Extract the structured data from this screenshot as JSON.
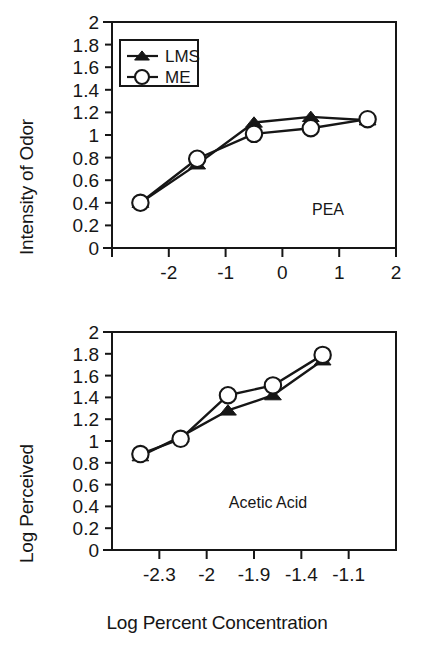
{
  "figure": {
    "background": "#ffffff",
    "ink": "#161616",
    "xaxis_title": "Log Percent Concentration"
  },
  "legend": {
    "entries": [
      {
        "label": "LMS",
        "marker": "filled-triangle"
      },
      {
        "label": "ME",
        "marker": "open-circle"
      }
    ]
  },
  "panels": {
    "top": {
      "ylabel": "Intensity of Odor",
      "annotation": "PEA"
    },
    "bottom": {
      "ylabel": "Log Perceived",
      "annotation": "Acetic Acid"
    }
  },
  "chart_data": [
    {
      "type": "line",
      "title": "PEA",
      "xlabel": "",
      "ylabel": "Intensity of Odor",
      "xlim": [
        -3,
        2
      ],
      "ylim": [
        0,
        2
      ],
      "xticks": [
        -3,
        -2,
        -1,
        0,
        1,
        2
      ],
      "xticklabels": [
        "",
        "-2",
        "-1",
        "0",
        "1",
        "2"
      ],
      "yticks": [
        0,
        0.2,
        0.4,
        0.6,
        0.8,
        1,
        1.2,
        1.4,
        1.6,
        1.8,
        2
      ],
      "yticklabels": [
        "0",
        "0.2",
        "0.4",
        "0.6",
        "0.8",
        "1",
        "1.2",
        "1.4",
        "1.6",
        "1.8",
        "2"
      ],
      "grid": false,
      "legend_position": "upper-left",
      "x": [
        -2.5,
        -1.5,
        -0.5,
        0.5,
        1.5
      ],
      "series": [
        {
          "name": "LMS",
          "marker": "filled-triangle",
          "values": [
            0.4,
            0.74,
            1.11,
            1.16,
            1.13
          ]
        },
        {
          "name": "ME",
          "marker": "open-circle",
          "values": [
            0.4,
            0.79,
            1.01,
            1.06,
            1.14
          ]
        }
      ]
    },
    {
      "type": "line",
      "title": "Acetic Acid",
      "xlabel": "Log Percent Concentration",
      "ylabel": "Log Perceived",
      "ylim": [
        0,
        2
      ],
      "xticklabels": [
        "-2.3",
        "-2",
        "-1.9",
        "-1.4",
        "-1.1"
      ],
      "xtick_positions": [
        1,
        2,
        3,
        4,
        5
      ],
      "yticks": [
        0,
        0.2,
        0.4,
        0.6,
        0.8,
        1,
        1.2,
        1.4,
        1.6,
        1.8,
        2
      ],
      "yticklabels": [
        "0",
        "0.2",
        "0.4",
        "0.6",
        "0.8",
        "1",
        "1.2",
        "1.4",
        "1.6",
        "1.8",
        "2"
      ],
      "grid": false,
      "legend_position": "none",
      "x": [
        0.6,
        1.45,
        2.45,
        3.4,
        4.45
      ],
      "series": [
        {
          "name": "LMS",
          "marker": "filled-triangle",
          "values": [
            0.86,
            1.04,
            1.28,
            1.42,
            1.74
          ]
        },
        {
          "name": "ME",
          "marker": "open-circle",
          "values": [
            0.88,
            1.02,
            1.42,
            1.51,
            1.79
          ]
        }
      ]
    }
  ]
}
